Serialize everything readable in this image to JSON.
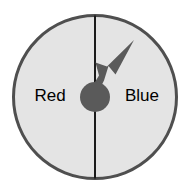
{
  "diagram": {
    "name": "two-sector-spinner",
    "title": "Spinner with Red and Blue halves",
    "background_color": "#ffffff",
    "wheel": {
      "center_x": 95,
      "center_y": 97,
      "radius": 83,
      "fill_color": "#e4e4e4",
      "border_color": "#4f4f4f",
      "border_width": 3
    },
    "divider": {
      "name": "vertical-divider",
      "orientation": "vertical",
      "x": 95,
      "color": "#1a1a1a",
      "width": 2
    },
    "sectors": [
      {
        "id": "red",
        "label": "Red",
        "side": "left",
        "label_x": 50,
        "label_y": 97,
        "fill_color": "#e4e4e4",
        "text_color": "#000000"
      },
      {
        "id": "blue",
        "label": "Blue",
        "side": "right",
        "label_x": 142,
        "label_y": 97,
        "fill_color": "#e4e4e4",
        "text_color": "#000000"
      }
    ],
    "pointer": {
      "name": "spinner-arrow",
      "color": "#5a5a5a",
      "pointing_direction": "up-right",
      "angle_degrees": 55,
      "tip_x": 134,
      "tip_y": 40,
      "hub": {
        "center_x": 95,
        "center_y": 97,
        "radius": 15,
        "color": "#5a5a5a"
      }
    }
  }
}
